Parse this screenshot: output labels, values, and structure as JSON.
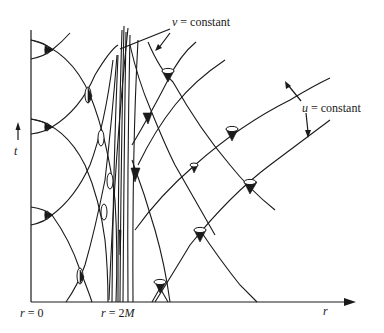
{
  "diagram": {
    "labels": {
      "v_constant": {
        "var": "v",
        "text": " = constant"
      },
      "u_constant": {
        "var": "u",
        "text": " = constant"
      },
      "t_axis": "t",
      "r_axis": "r",
      "r_zero": {
        "var": "r",
        "text": " = 0"
      },
      "r_horizon": {
        "var": "r",
        "text": " = 2",
        "mass": "M"
      }
    },
    "icons": {
      "axis_arrow": "arrow-right",
      "t_arrow": "arrow-up",
      "light_cone": "light-cone"
    }
  }
}
